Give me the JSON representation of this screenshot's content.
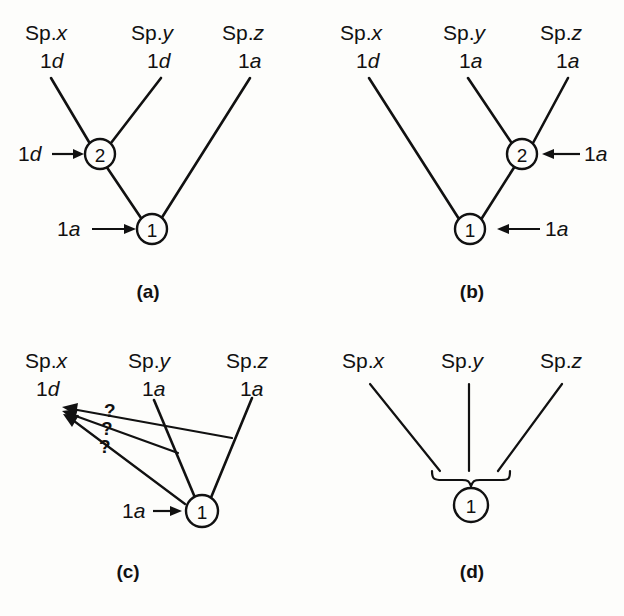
{
  "figure": {
    "background_color": "#fdfdfb",
    "ink_color": "#111111",
    "panel_count": 4
  },
  "panels": {
    "a": {
      "caption": "(a)",
      "taxa": [
        {
          "genus": "Sp.",
          "species": "x",
          "state_digit": "1",
          "state_letter": "d"
        },
        {
          "genus": "Sp.",
          "species": "y",
          "state_digit": "1",
          "state_letter": "d"
        },
        {
          "genus": "Sp.",
          "species": "z",
          "state_digit": "1",
          "state_letter": "a"
        }
      ],
      "nodes": [
        {
          "id": "2",
          "label": "2"
        },
        {
          "id": "1",
          "label": "1"
        }
      ],
      "annotations": [
        {
          "digit": "1",
          "letter": "d",
          "points_to": "node-2"
        },
        {
          "digit": "1",
          "letter": "a",
          "points_to": "node-1"
        }
      ]
    },
    "b": {
      "caption": "(b)",
      "taxa": [
        {
          "genus": "Sp.",
          "species": "x",
          "state_digit": "1",
          "state_letter": "d"
        },
        {
          "genus": "Sp.",
          "species": "y",
          "state_digit": "1",
          "state_letter": "a"
        },
        {
          "genus": "Sp.",
          "species": "z",
          "state_digit": "1",
          "state_letter": "a"
        }
      ],
      "nodes": [
        {
          "id": "2",
          "label": "2"
        },
        {
          "id": "1",
          "label": "1"
        }
      ],
      "annotations": [
        {
          "digit": "1",
          "letter": "a",
          "points_to": "node-2"
        },
        {
          "digit": "1",
          "letter": "a",
          "points_to": "node-1"
        }
      ]
    },
    "c": {
      "caption": "(c)",
      "taxa": [
        {
          "genus": "Sp.",
          "species": "x",
          "state_digit": "1",
          "state_letter": "d"
        },
        {
          "genus": "Sp.",
          "species": "y",
          "state_digit": "1",
          "state_letter": "a"
        },
        {
          "genus": "Sp.",
          "species": "z",
          "state_digit": "1",
          "state_letter": "a"
        }
      ],
      "nodes": [
        {
          "id": "1",
          "label": "1"
        }
      ],
      "annotations": [
        {
          "digit": "1",
          "letter": "a",
          "points_to": "node-1"
        }
      ],
      "query_marks": [
        {
          "symbol": "?",
          "from": "sp-z-branch",
          "to": "sp-x-tip"
        },
        {
          "symbol": "?",
          "from": "sp-y-branch",
          "to": "sp-x-tip"
        },
        {
          "symbol": "?",
          "from": "node-1",
          "to": "sp-x-tip"
        }
      ]
    },
    "d": {
      "caption": "(d)",
      "taxa": [
        {
          "genus": "Sp.",
          "species": "x",
          "state_digit": "",
          "state_letter": ""
        },
        {
          "genus": "Sp.",
          "species": "y",
          "state_digit": "",
          "state_letter": ""
        },
        {
          "genus": "Sp.",
          "species": "z",
          "state_digit": "",
          "state_letter": ""
        }
      ],
      "nodes": [
        {
          "id": "1",
          "label": "1"
        }
      ],
      "annotations": [],
      "polytomy_brace": true
    }
  }
}
